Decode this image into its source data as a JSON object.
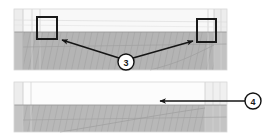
{
  "figure": {
    "type": "annotated-elevation-drawing",
    "background_color": "#ffffff",
    "width": 276,
    "height": 137
  },
  "panels": [
    {
      "id": "upper-panel",
      "name": "upper-elevation-view",
      "x": 14,
      "y": 9,
      "width": 213,
      "height": 61,
      "sky_band": {
        "height": 22,
        "color": "#f7f7f7"
      },
      "ground_band": {
        "color": "#b4b4b4",
        "hatch": "diagonal"
      },
      "border_color": "#cfcfcf"
    },
    {
      "id": "lower-panel",
      "name": "lower-elevation-view",
      "x": 14,
      "y": 82,
      "width": 213,
      "height": 50,
      "sky_band": {
        "height": 22,
        "color": "#fbfbfb"
      },
      "ground_band": {
        "color": "#b4b4b4",
        "hatch": "diagonal"
      },
      "border_color": "#cfcfcf"
    }
  ],
  "highlight_boxes": [
    {
      "name": "left-highlight-box",
      "x": 37,
      "y": 17,
      "width": 20,
      "height": 22,
      "stroke_color": "#1a1a1a",
      "stroke_width": 2,
      "fill": "none"
    },
    {
      "name": "right-highlight-box",
      "x": 197,
      "y": 19,
      "width": 19,
      "height": 23,
      "stroke_color": "#1a1a1a",
      "stroke_width": 2,
      "fill": "none"
    }
  ],
  "callouts": [
    {
      "id": "callout-3",
      "label": "3",
      "circle": {
        "cx": 126,
        "cy": 62,
        "r": 8
      },
      "circle_fill": "#ffffff",
      "circle_stroke": "#111111",
      "text_color": "#1a1a1a",
      "leaders": [
        {
          "name": "leader-left",
          "from_x": 119,
          "from_y": 58,
          "to_x": 59,
          "to_y": 39
        },
        {
          "name": "leader-right",
          "from_x": 133,
          "from_y": 58,
          "to_x": 196,
          "to_y": 41
        }
      ]
    },
    {
      "id": "callout-4",
      "label": "4",
      "circle": {
        "cx": 253,
        "cy": 101,
        "r": 8
      },
      "circle_fill": "#ffffff",
      "circle_stroke": "#111111",
      "text_color": "#1a1a1a",
      "leaders": [
        {
          "name": "leader-left",
          "from_x": 245,
          "from_y": 101,
          "to_x": 158,
          "to_y": 101
        }
      ]
    }
  ],
  "colors": {
    "ink": "#1a1a1a",
    "ground_grey": "#b4b4b4",
    "light_grey": "#d8d8d8",
    "sky_white": "#fafafa",
    "panel_border": "#cfcfcf"
  }
}
